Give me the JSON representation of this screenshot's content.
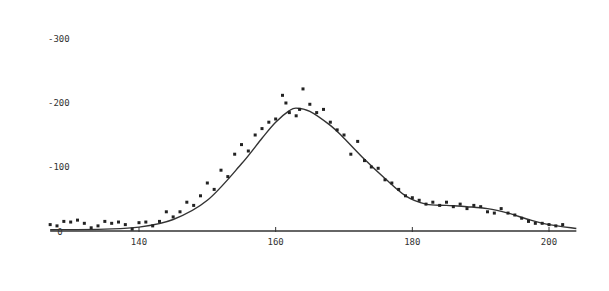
{
  "chart_data": {
    "type": "scatter",
    "title": "",
    "xlabel": "",
    "ylabel": "",
    "xlim": [
      127,
      204
    ],
    "ylim": [
      0,
      300
    ],
    "grid": false,
    "legend": null,
    "x_ticks": [
      140,
      160,
      180,
      200
    ],
    "y_ticks": [
      0,
      100,
      200,
      300
    ],
    "x_tick_labels": [
      "140",
      "160",
      "180",
      "200"
    ],
    "y_tick_labels": [
      "0",
      "100",
      "200",
      "300"
    ],
    "series": [
      {
        "name": "data points",
        "kind": "scatter",
        "x": [
          127,
          128,
          129,
          130,
          131,
          132,
          133,
          134,
          135,
          136,
          137,
          138,
          139,
          140,
          141,
          142,
          143,
          144,
          145,
          146,
          147,
          148,
          149,
          150,
          151,
          152,
          153,
          154,
          155,
          156,
          157,
          158,
          159,
          160,
          161,
          161.5,
          162,
          163,
          163.5,
          164,
          165,
          166,
          167,
          168,
          169,
          170,
          171,
          172,
          173,
          174,
          175,
          176,
          177,
          178,
          179,
          180,
          181,
          182,
          183,
          184,
          185,
          186,
          187,
          188,
          189,
          190,
          191,
          192,
          193,
          194,
          195,
          196,
          197,
          198,
          199,
          200,
          201,
          202
        ],
        "y": [
          10,
          8,
          15,
          14,
          17,
          12,
          5,
          8,
          15,
          12,
          14,
          10,
          3,
          13,
          14,
          8,
          15,
          30,
          22,
          30,
          45,
          40,
          55,
          75,
          65,
          95,
          85,
          120,
          135,
          125,
          150,
          160,
          170,
          175,
          212,
          200,
          185,
          180,
          190,
          222,
          198,
          185,
          190,
          170,
          158,
          150,
          120,
          140,
          110,
          100,
          98,
          80,
          75,
          65,
          55,
          52,
          48,
          42,
          45,
          40,
          45,
          38,
          42,
          35,
          40,
          38,
          30,
          28,
          35,
          28,
          25,
          20,
          15,
          12,
          12,
          10,
          8,
          10
        ]
      },
      {
        "name": "fitted curve",
        "kind": "line",
        "x": [
          127,
          135,
          140,
          145,
          150,
          155,
          158,
          160,
          162,
          163,
          165,
          168,
          170,
          173,
          176,
          179,
          182,
          185,
          188,
          191,
          194,
          197,
          200,
          204
        ],
        "y": [
          2,
          3,
          6,
          18,
          48,
          105,
          145,
          170,
          188,
          192,
          187,
          165,
          145,
          112,
          82,
          55,
          42,
          40,
          38,
          35,
          28,
          18,
          10,
          4
        ]
      }
    ],
    "colors": {
      "points": "#222222",
      "curve": "#333333",
      "axis": "#333333",
      "background": "#ffffff"
    }
  }
}
